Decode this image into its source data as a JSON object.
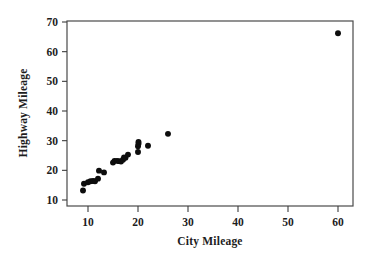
{
  "chart_data": {
    "type": "scatter",
    "title": "",
    "xlabel": "City Mileage",
    "ylabel": "Highway Mileage",
    "xlim": [
      6.5,
      62.5
    ],
    "ylim": [
      9.4,
      70.2
    ],
    "xticks": [
      10,
      20,
      30,
      40,
      50,
      60
    ],
    "xtick_labels": [
      "10",
      "20",
      "30",
      "40",
      "50",
      "60"
    ],
    "yticks": [
      10,
      20,
      30,
      40,
      50,
      60,
      70
    ],
    "ytick_labels": [
      "10",
      "20",
      "30",
      "40",
      "50",
      "60",
      "70"
    ],
    "grid": false,
    "legend": null,
    "marker": "filled-circle",
    "marker_color": "#0d0d0d",
    "marker_size": 4,
    "frame_color": "#4a4a4a",
    "background_color": "#ffffff",
    "series": [
      {
        "name": "Vehicles",
        "points": [
          [
            9.0,
            13.2
          ],
          [
            9.2,
            15.5
          ],
          [
            10.0,
            16.0
          ],
          [
            10.5,
            16.3
          ],
          [
            11.0,
            16.4
          ],
          [
            11.4,
            16.3
          ],
          [
            12.0,
            17.2
          ],
          [
            12.2,
            19.9
          ],
          [
            13.2,
            19.3
          ],
          [
            15.0,
            22.6
          ],
          [
            15.3,
            23.2
          ],
          [
            15.8,
            23.2
          ],
          [
            16.2,
            23.1
          ],
          [
            16.6,
            23.0
          ],
          [
            17.0,
            23.6
          ],
          [
            17.2,
            24.3
          ],
          [
            17.5,
            24.2
          ],
          [
            18.0,
            25.3
          ],
          [
            20.0,
            26.2
          ],
          [
            20.0,
            28.1
          ],
          [
            20.1,
            29.0
          ],
          [
            20.1,
            29.6
          ],
          [
            22.0,
            28.3
          ],
          [
            26.0,
            32.3
          ],
          [
            60.0,
            66.2
          ]
        ]
      }
    ]
  },
  "axes": {
    "x_axis_name": "x-axis",
    "y_axis_name": "y-axis"
  }
}
